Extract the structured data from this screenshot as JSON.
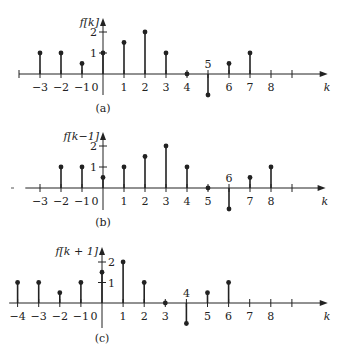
{
  "chart_data": [
    {
      "type": "stem",
      "panel": "(a)",
      "ylabel": "f[k]",
      "xlabel": "k",
      "origin": {
        "x": 103,
        "y": 74
      },
      "unit_x": 21,
      "unit_y": 21,
      "axis_x_range": [
        -4.0,
        10.7
      ],
      "axis_y_top": 18,
      "axis_y_bottom": 95,
      "x_ticks": [
        -4,
        -3,
        -2,
        -1,
        0,
        1,
        2,
        3,
        4,
        5,
        6,
        7,
        8,
        9
      ],
      "x_tick_labels": [
        "",
        "−3",
        "−2",
        "−1",
        "0",
        "1",
        "2",
        "3",
        "4",
        "5",
        "6",
        "7",
        "8",
        ""
      ],
      "y_ticks": [
        1,
        2
      ],
      "y_tick_labels": [
        "1",
        "2"
      ],
      "k": [
        -3,
        -2,
        -1,
        0,
        1,
        2,
        3,
        4,
        5,
        6,
        7
      ],
      "values": [
        1,
        1,
        0.5,
        1,
        1.5,
        2,
        1,
        0,
        -1,
        0.5,
        1
      ],
      "caption": "(a)",
      "caption_y": 112
    },
    {
      "type": "stem",
      "panel": "(b)",
      "ylabel": "f[k−1]",
      "xlabel": "k",
      "origin": {
        "x": 103,
        "y": 188
      },
      "unit_x": 21,
      "unit_y": 21,
      "axis_x_range": [
        -3.7,
        10.6
      ],
      "axis_y_top": 132,
      "axis_y_bottom": 210,
      "x_ticks": [
        -3,
        -2,
        -1,
        0,
        1,
        2,
        3,
        4,
        5,
        6,
        7,
        8,
        9
      ],
      "x_tick_labels": [
        "−3",
        "−2",
        "−1",
        "0",
        "1",
        "2",
        "3",
        "4",
        "5",
        "6",
        "7",
        "8",
        ""
      ],
      "y_ticks": [
        1,
        2
      ],
      "y_tick_labels": [
        "1",
        "2"
      ],
      "k": [
        -2,
        -1,
        0,
        1,
        2,
        3,
        4,
        5,
        6,
        7,
        8
      ],
      "values": [
        1,
        1,
        0.5,
        1,
        1.5,
        2,
        1,
        0,
        -1,
        0.5,
        1
      ],
      "caption": "(b)",
      "caption_y": 226
    },
    {
      "type": "stem",
      "panel": "(c)",
      "ylabel": "f[k + 1]",
      "xlabel": "k",
      "origin": {
        "x": 102,
        "y": 303
      },
      "unit_x": 21.1,
      "unit_y": 20.5,
      "axis_x_range": [
        -4.4,
        10.7
      ],
      "axis_y_top": 247,
      "axis_y_bottom": 328,
      "x_ticks": [
        -4,
        -3,
        -2,
        -1,
        0,
        1,
        2,
        3,
        4,
        5,
        6,
        7,
        8,
        9
      ],
      "x_tick_labels": [
        "−4",
        "−3",
        "−2",
        "−1",
        "0",
        "1",
        "2",
        "3",
        "4",
        "5",
        "6",
        "7",
        "8",
        ""
      ],
      "y_ticks": [
        1,
        2
      ],
      "y_tick_labels": [
        "1",
        "2"
      ],
      "k": [
        -4,
        -3,
        -2,
        -1,
        0,
        1,
        2,
        3,
        4,
        5,
        6
      ],
      "values": [
        1,
        1,
        0.5,
        1,
        1.5,
        2,
        1,
        0,
        -1,
        0.5,
        1
      ],
      "caption": "(c)",
      "caption_y": 342
    }
  ],
  "style": {
    "stroke": "#222222",
    "background": "#ffffff"
  }
}
